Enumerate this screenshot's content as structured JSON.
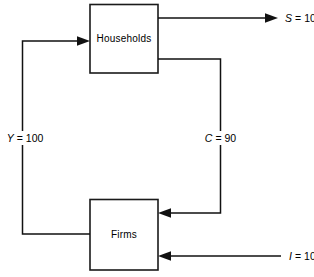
{
  "diagram": {
    "type": "flow-diagram",
    "nodes": [
      {
        "id": "households",
        "label": "Households"
      },
      {
        "id": "firms",
        "label": "Firms"
      }
    ],
    "flows": [
      {
        "id": "savings",
        "symbol": "S",
        "equals": "=",
        "value": "10",
        "label": "S = 10",
        "from": "households",
        "to": "outside",
        "direction": "right"
      },
      {
        "id": "consumption",
        "symbol": "C",
        "equals": "=",
        "value": "90",
        "label": "C = 90",
        "from": "households",
        "to": "firms",
        "direction": "down-left"
      },
      {
        "id": "income",
        "symbol": "Y",
        "equals": "=",
        "value": "100",
        "label": "Y = 100",
        "from": "firms",
        "to": "households",
        "direction": "up-right"
      },
      {
        "id": "investment",
        "symbol": "I",
        "equals": "=",
        "value": "10",
        "label": "I = 10",
        "from": "outside",
        "to": "firms",
        "direction": "left"
      }
    ],
    "colors": {
      "line": "#111111",
      "box_stroke": "#1a1a1a",
      "background": "#ffffff",
      "text": "#000000"
    }
  }
}
